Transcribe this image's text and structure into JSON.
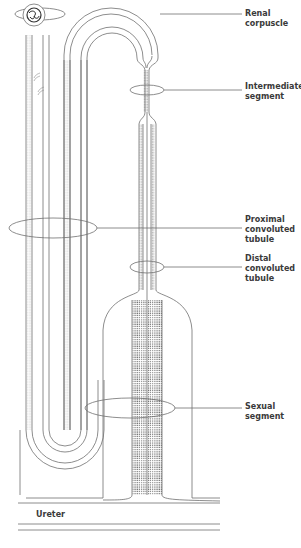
{
  "figure": {
    "type": "schematic nephron diagram",
    "colors": {
      "line": "#707070",
      "label": "#3a3a3a",
      "dots": "#5a5a5a",
      "background": "#ffffff"
    }
  },
  "labels": [
    {
      "id": "renal-corpuscle",
      "text": "Renal corpuscle"
    },
    {
      "id": "intermediate-segment",
      "text": "Intermediate\nsegment"
    },
    {
      "id": "proximal-convoluted-tubule",
      "text": "Proximal\nconvoluted\ntubule"
    },
    {
      "id": "distal-convoluted-tubule",
      "text": "Distal\nconvoluted\ntubule"
    },
    {
      "id": "sexual-segment",
      "text": "Sexual\nsegment"
    },
    {
      "id": "ureter",
      "text": "Ureter"
    }
  ]
}
